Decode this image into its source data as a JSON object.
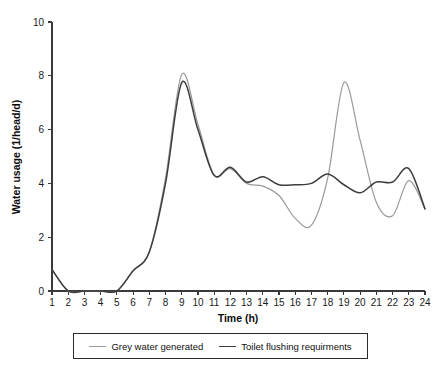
{
  "chart_data": {
    "type": "line",
    "title": "",
    "xlabel": "Time (h)",
    "ylabel": "Water usage (1/head/d)",
    "xlim": [
      1,
      24
    ],
    "ylim": [
      0,
      10
    ],
    "xticks": [
      1,
      2,
      3,
      4,
      5,
      6,
      7,
      8,
      9,
      10,
      11,
      12,
      13,
      14,
      15,
      16,
      17,
      18,
      19,
      20,
      21,
      22,
      23,
      24
    ],
    "yticks": [
      0,
      2,
      4,
      6,
      8,
      10
    ],
    "grid": false,
    "legend_position": "below-axes",
    "x": [
      1,
      2,
      3,
      4,
      5,
      6,
      7,
      8,
      9,
      10,
      11,
      12,
      13,
      14,
      15,
      16,
      17,
      18,
      19,
      20,
      21,
      22,
      23,
      24
    ],
    "series": [
      {
        "name": "Grey water generated",
        "color": "#9a9a9a",
        "values": [
          0.8,
          0.0,
          0.0,
          0.0,
          0.0,
          0.75,
          1.45,
          4.2,
          8.05,
          6.2,
          4.3,
          4.55,
          4.0,
          3.9,
          3.55,
          2.7,
          2.45,
          4.2,
          7.75,
          5.6,
          3.3,
          2.8,
          4.1,
          3.05
        ]
      },
      {
        "name": "Toilet flushing requirments",
        "color": "#3d3d3d",
        "values": [
          0.8,
          0.0,
          0.0,
          0.0,
          0.0,
          0.75,
          1.45,
          4.0,
          7.75,
          6.0,
          4.3,
          4.6,
          4.05,
          4.25,
          3.95,
          3.95,
          4.0,
          4.35,
          3.95,
          3.65,
          4.05,
          4.05,
          4.55,
          3.05
        ]
      }
    ],
    "annotations": []
  },
  "axes": {
    "y_title": "Water usage (1/head/d)",
    "x_title": "Time (h)",
    "y_tick_labels": [
      "0",
      "2",
      "4",
      "6",
      "8",
      "10"
    ],
    "x_tick_labels": [
      "1",
      "2",
      "3",
      "4",
      "5",
      "6",
      "7",
      "8",
      "9",
      "10",
      "11",
      "12",
      "13",
      "14",
      "15",
      "16",
      "17",
      "18",
      "19",
      "20",
      "21",
      "22",
      "23",
      "24"
    ]
  },
  "legend": {
    "entries": [
      {
        "label": "Grey water generated",
        "color": "#9a9a9a"
      },
      {
        "label": "Toilet flushing requirments",
        "color": "#3d3d3d"
      }
    ]
  },
  "colors": {
    "grey_water": "#9a9a9a",
    "toilet_flushing": "#3d3d3d",
    "axis": "#3a3a3a",
    "background": "#ffffff"
  }
}
